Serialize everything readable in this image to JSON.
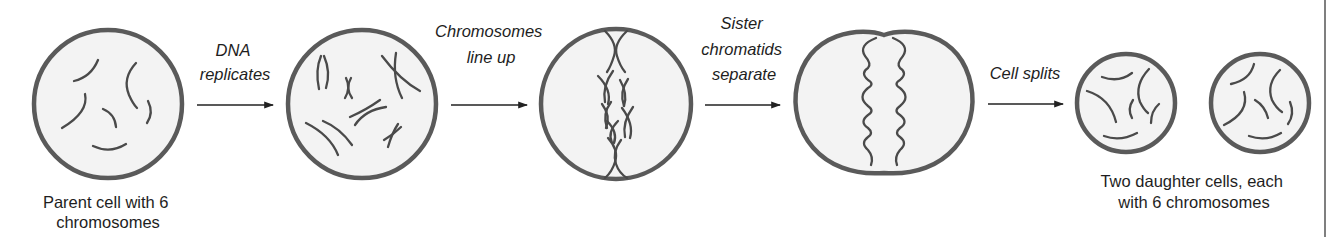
{
  "diagram": {
    "colors": {
      "cell_stroke": "#5a5a5a",
      "cell_fill": "#f3f3f3",
      "chromosome": "#4a4a4a",
      "text": "#1e1e1e",
      "background": "#ffffff"
    },
    "stages": [
      {
        "id": "parent-cell",
        "caption_lines": [
          "Parent cell with 6",
          "chromosomes"
        ],
        "chromosome_count": 6
      },
      {
        "id": "replicated-cell",
        "caption_lines": []
      },
      {
        "id": "metaphase-cell",
        "caption_lines": []
      },
      {
        "id": "anaphase-cell",
        "caption_lines": []
      },
      {
        "id": "daughter-cells",
        "caption_lines": [
          "Two daughter cells, each",
          "with 6 chromosomes"
        ],
        "cell_count": 2,
        "chromosome_count_each": 6
      }
    ],
    "transitions": [
      {
        "label_lines": [
          "DNA",
          "replicates"
        ],
        "icon": "arrow-right-icon"
      },
      {
        "label_lines": [
          "Chromosomes",
          "line up"
        ],
        "icon": "arrow-right-icon"
      },
      {
        "label_lines": [
          "Sister",
          "chromatids",
          "separate"
        ],
        "icon": "arrow-right-icon"
      },
      {
        "label_lines": [
          "Cell splits"
        ],
        "icon": "arrow-right-icon"
      }
    ]
  }
}
